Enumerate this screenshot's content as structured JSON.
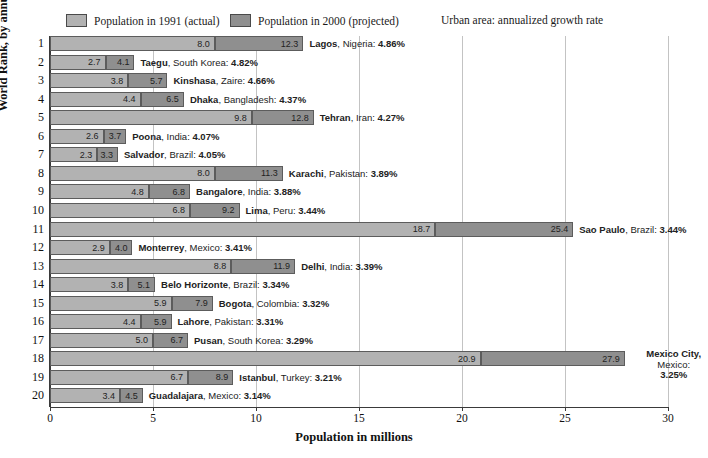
{
  "legend": {
    "series1_label": "Population in 1991 (actual)",
    "series2_label": "Population in 2000 (projected)",
    "note": "Urban area:  annualized growth rate",
    "series1_color": "#b2b2b2",
    "series2_color": "#8f8f8f"
  },
  "axes": {
    "xlabel": "Population in millions",
    "ylabel": "World Rank, by annualized growth rate",
    "xticks": [
      0,
      5,
      10,
      15,
      20,
      25,
      30
    ]
  },
  "chart_data": {
    "type": "bar",
    "title": "",
    "subtitle": "",
    "orientation": "horizontal",
    "stacked": true,
    "xlabel": "Population in millions",
    "ylabel": "World Rank, by annualized growth rate",
    "xlim": [
      0,
      30
    ],
    "xticks": [
      0,
      5,
      10,
      15,
      20,
      25,
      30
    ],
    "grid": "vertical",
    "legend_position": "top",
    "legend": [
      "Population in 1991 (actual)",
      "Population in 2000 (projected)"
    ],
    "categories": [
      "Lagos, Nigeria",
      "Taegu, South Korea",
      "Kinshasa, Zaire",
      "Dhaka, Bangladesh",
      "Tehran, Iran",
      "Poona, India",
      "Salvador, Brazil",
      "Karachi, Pakistan",
      "Bangalore, India",
      "Lima, Peru",
      "Sao Paulo, Brazil",
      "Monterrey, Mexico",
      "Delhi, India",
      "Belo Horizonte, Brazil",
      "Bogota, Colombia",
      "Lahore, Pakistan",
      "Pusan, South Korea",
      "Mexico City, Mexico",
      "Istanbul, Turkey",
      "Guadalajara, Mexico"
    ],
    "series": [
      {
        "name": "Population in 1991 (actual)",
        "values": [
          8.0,
          2.7,
          3.8,
          4.4,
          9.8,
          2.6,
          2.3,
          8.0,
          4.8,
          6.8,
          18.7,
          2.9,
          8.8,
          3.8,
          5.9,
          4.4,
          5.0,
          20.9,
          6.7,
          3.4
        ]
      },
      {
        "name": "Population in 2000 (projected)",
        "values": [
          12.3,
          4.1,
          5.7,
          6.5,
          12.8,
          3.7,
          3.3,
          11.3,
          6.8,
          9.2,
          25.4,
          4.0,
          11.9,
          5.1,
          7.9,
          5.9,
          6.7,
          27.9,
          8.9,
          4.5
        ]
      }
    ],
    "growth_rates": [
      "4.86%",
      "4.82%",
      "4.66%",
      "4.37%",
      "4.27%",
      "4.07%",
      "4.05%",
      "3.89%",
      "3.88%",
      "3.44%",
      "3.44%",
      "3.41%",
      "3.39%",
      "3.34%",
      "3.32%",
      "3.31%",
      "3.29%",
      "3.25%",
      "3.21%",
      "3.14%"
    ]
  },
  "rows": [
    {
      "rank": "1",
      "city": "Lagos",
      "country": "Nigeria",
      "pct": "4.86%",
      "v1991": 8.0,
      "v2000": 12.3,
      "l1991": "8.0",
      "l2000": "12.3",
      "multiline": false
    },
    {
      "rank": "2",
      "city": "Taegu",
      "country": "South Korea",
      "pct": "4.82%",
      "v1991": 2.7,
      "v2000": 4.1,
      "l1991": "2.7",
      "l2000": "4.1",
      "multiline": false
    },
    {
      "rank": "3",
      "city": "Kinshasa",
      "country": "Zaire",
      "pct": "4.66%",
      "v1991": 3.8,
      "v2000": 5.7,
      "l1991": "3.8",
      "l2000": "5.7",
      "multiline": false
    },
    {
      "rank": "4",
      "city": "Dhaka",
      "country": "Bangladesh",
      "pct": "4.37%",
      "v1991": 4.4,
      "v2000": 6.5,
      "l1991": "4.4",
      "l2000": "6.5",
      "multiline": false
    },
    {
      "rank": "5",
      "city": "Tehran",
      "country": "Iran",
      "pct": "4.27%",
      "v1991": 9.8,
      "v2000": 12.8,
      "l1991": "9.8",
      "l2000": "12.8",
      "multiline": false
    },
    {
      "rank": "6",
      "city": "Poona",
      "country": "India",
      "pct": "4.07%",
      "v1991": 2.6,
      "v2000": 3.7,
      "l1991": "2.6",
      "l2000": "3.7",
      "multiline": false
    },
    {
      "rank": "7",
      "city": "Salvador",
      "country": "Brazil",
      "pct": "4.05%",
      "v1991": 2.3,
      "v2000": 3.3,
      "l1991": "2.3",
      "l2000": "3.3",
      "multiline": false
    },
    {
      "rank": "8",
      "city": "Karachi",
      "country": "Pakistan",
      "pct": "3.89%",
      "v1991": 8.0,
      "v2000": 11.3,
      "l1991": "8.0",
      "l2000": "11.3",
      "multiline": false
    },
    {
      "rank": "9",
      "city": "Bangalore",
      "country": "India",
      "pct": "3.88%",
      "v1991": 4.8,
      "v2000": 6.8,
      "l1991": "4.8",
      "l2000": "6.8",
      "multiline": false
    },
    {
      "rank": "10",
      "city": "Lima",
      "country": "Peru",
      "pct": "3.44%",
      "v1991": 6.8,
      "v2000": 9.2,
      "l1991": "6.8",
      "l2000": "9.2",
      "multiline": false
    },
    {
      "rank": "11",
      "city": "Sao Paulo",
      "country": "Brazil",
      "pct": "3.44%",
      "v1991": 18.7,
      "v2000": 25.4,
      "l1991": "18.7",
      "l2000": "25.4",
      "multiline": false
    },
    {
      "rank": "12",
      "city": "Monterrey",
      "country": "Mexico",
      "pct": "3.41%",
      "v1991": 2.9,
      "v2000": 4.0,
      "l1991": "2.9",
      "l2000": "4.0",
      "multiline": false
    },
    {
      "rank": "13",
      "city": "Delhi",
      "country": "India",
      "pct": "3.39%",
      "v1991": 8.8,
      "v2000": 11.9,
      "l1991": "8.8",
      "l2000": "11.9",
      "multiline": false
    },
    {
      "rank": "14",
      "city": "Belo Horizonte",
      "country": "Brazil",
      "pct": "3.34%",
      "v1991": 3.8,
      "v2000": 5.1,
      "l1991": "3.8",
      "l2000": "5.1",
      "multiline": false
    },
    {
      "rank": "15",
      "city": "Bogota",
      "country": "Colombia",
      "pct": "3.32%",
      "v1991": 5.9,
      "v2000": 7.9,
      "l1991": "5.9",
      "l2000": "7.9",
      "multiline": false
    },
    {
      "rank": "16",
      "city": "Lahore",
      "country": "Pakistan",
      "pct": "3.31%",
      "v1991": 4.4,
      "v2000": 5.9,
      "l1991": "4.4",
      "l2000": "5.9",
      "multiline": false
    },
    {
      "rank": "17",
      "city": "Pusan",
      "country": "South Korea",
      "pct": "3.29%",
      "v1991": 5.0,
      "v2000": 6.7,
      "l1991": "5.0",
      "l2000": "6.7",
      "multiline": false
    },
    {
      "rank": "18",
      "city": "Mexico City",
      "country": "Mexico",
      "pct": "3.25%",
      "v1991": 20.9,
      "v2000": 27.9,
      "l1991": "20.9",
      "l2000": "27.9",
      "multiline": true
    },
    {
      "rank": "19",
      "city": "Istanbul",
      "country": "Turkey",
      "pct": "3.21%",
      "v1991": 6.7,
      "v2000": 8.9,
      "l1991": "6.7",
      "l2000": "8.9",
      "multiline": false
    },
    {
      "rank": "20",
      "city": "Guadalajara",
      "country": "Mexico",
      "pct": "3.14%",
      "v1991": 3.4,
      "v2000": 4.5,
      "l1991": "3.4",
      "l2000": "4.5",
      "multiline": false
    }
  ]
}
